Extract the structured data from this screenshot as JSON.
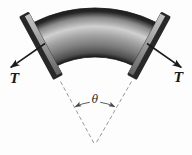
{
  "figure": {
    "kind": "torsion-of-curved-bar-diagram",
    "labels": {
      "torque_left": "T",
      "torque_right": "T",
      "angle": "θ"
    },
    "colors": {
      "background": "#fdfdfd",
      "ink": "#1b1b1b",
      "dashed_line": "#8c8c8c",
      "arc_line": "#4a4a4a",
      "pipe_outline": "#161616",
      "pipe_rim": "#1d1d1d",
      "pipe_outer_rim": "#262626",
      "pipe_upper": "#8a8a8a",
      "pipe_highlight": "#d0d0d0",
      "pipe_mid": "#a2a2a2",
      "pipe_dusk": "#7d7d7d",
      "pipe_shadow": "#4f4f4f",
      "flange_rim": "#282828",
      "flange_face_light": "#c4c4c4",
      "flange_face_mid": "#979797",
      "flange_face_dark": "#636363"
    }
  }
}
